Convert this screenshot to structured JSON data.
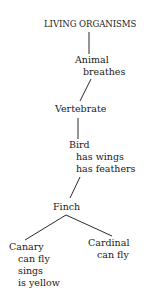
{
  "diagram": {
    "type": "hierarchy-tree",
    "nodes": [
      {
        "id": "root",
        "name": "LIVING ORGANISMS",
        "properties": []
      },
      {
        "id": "animal",
        "name": "Animal",
        "properties": [
          "breathes"
        ],
        "parent": "root"
      },
      {
        "id": "vertebrate",
        "name": "Vertebrate",
        "properties": [],
        "parent": "animal"
      },
      {
        "id": "bird",
        "name": "Bird",
        "properties": [
          "has wings",
          "has feathers"
        ],
        "parent": "vertebrate"
      },
      {
        "id": "finch",
        "name": "Finch",
        "properties": [],
        "parent": "bird"
      },
      {
        "id": "canary",
        "name": "Canary",
        "properties": [
          "can fly",
          "sings",
          "is yellow"
        ],
        "parent": "finch"
      },
      {
        "id": "cardinal",
        "name": "Cardinal",
        "properties": [
          "can fly"
        ],
        "parent": "finch"
      }
    ],
    "line_color": "#2a2a2a",
    "text_color": "#1a1a1a"
  }
}
